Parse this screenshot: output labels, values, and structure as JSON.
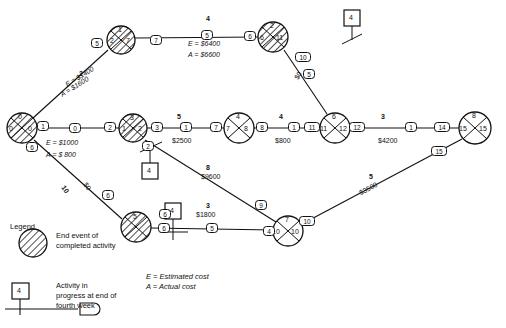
{
  "diagram": {
    "type": "pert-cpm-network",
    "title": "",
    "events": [
      {
        "id": "e0",
        "label_top": "0",
        "label_left": "0",
        "label_right": "0",
        "hatched": true,
        "x": 22,
        "y": 128,
        "r": 15
      },
      {
        "id": "e13",
        "label_top": "1",
        "label_left": "2",
        "label_right": "7",
        "hatched": true,
        "x": 133,
        "y": 128,
        "r": 14
      },
      {
        "id": "e3",
        "label_top": "3",
        "label_left": "1",
        "label_right": "2",
        "hatched": true,
        "x": 133,
        "y": 128,
        "r": 14
      },
      {
        "id": "e_top_left",
        "label_top": "1",
        "label_left": "2",
        "label_right": "7",
        "hatched": true,
        "x": 121,
        "y": 40,
        "r": 14
      },
      {
        "id": "e_top_right",
        "label_top": "2",
        "label_left": "6",
        "label_right": "11",
        "hatched": true,
        "x": 273,
        "y": 37,
        "r": 15
      },
      {
        "id": "e74",
        "label_top": "4",
        "label_left": "7",
        "label_right": "8",
        "hatched": false,
        "x": 239,
        "y": 128,
        "r": 15
      },
      {
        "id": "e1112",
        "label_top": "6",
        "label_left": "11",
        "label_right": "12",
        "hatched": false,
        "x": 335,
        "y": 128,
        "r": 15
      },
      {
        "id": "e1515",
        "label_top": "8",
        "label_left": "15",
        "label_right": "15",
        "hatched": false,
        "x": 475,
        "y": 128,
        "r": 16
      },
      {
        "id": "e_bottom_left",
        "label_top": "5",
        "label_left": "",
        "label_right": "",
        "hatched": true,
        "x": 136,
        "y": 227,
        "r": 15
      },
      {
        "id": "e1010",
        "label_top": "7",
        "label_left": "10",
        "label_right": "10",
        "hatched": false,
        "x": 288,
        "y": 231,
        "r": 15
      }
    ],
    "activity_tags": [
      {
        "text": "5",
        "x": 97,
        "y": 43
      },
      {
        "text": "7",
        "x": 156,
        "y": 40
      },
      {
        "text": "5",
        "x": 207,
        "y": 35
      },
      {
        "text": "6",
        "x": 250,
        "y": 36
      },
      {
        "text": "1",
        "x": 43,
        "y": 126
      },
      {
        "text": "0",
        "x": 75,
        "y": 128
      },
      {
        "text": "2",
        "x": 110,
        "y": 127
      },
      {
        "text": "3",
        "x": 157,
        "y": 127
      },
      {
        "text": "1",
        "x": 186,
        "y": 127
      },
      {
        "text": "7",
        "x": 216,
        "y": 127
      },
      {
        "text": "8",
        "x": 262,
        "y": 127
      },
      {
        "text": "1",
        "x": 294,
        "y": 127
      },
      {
        "text": "11",
        "x": 312,
        "y": 127
      },
      {
        "text": "12",
        "x": 357,
        "y": 127
      },
      {
        "text": "1",
        "x": 411,
        "y": 127
      },
      {
        "text": "14",
        "x": 442,
        "y": 127
      },
      {
        "text": "15",
        "x": 439,
        "y": 151
      },
      {
        "text": "6",
        "x": 32,
        "y": 147
      },
      {
        "text": "2",
        "x": 148,
        "y": 146
      },
      {
        "text": "6",
        "x": 108,
        "y": 195
      },
      {
        "text": "6",
        "x": 165,
        "y": 214
      },
      {
        "text": "6",
        "x": 164,
        "y": 228
      },
      {
        "text": "5",
        "x": 212,
        "y": 228
      },
      {
        "text": "4",
        "x": 269,
        "y": 231
      },
      {
        "text": "10",
        "x": 307,
        "y": 221
      },
      {
        "text": "9",
        "x": 261,
        "y": 205
      },
      {
        "text": "10",
        "x": 303,
        "y": 57
      },
      {
        "text": "5",
        "x": 309,
        "y": 74
      }
    ],
    "edge_labels": [
      {
        "text": "4",
        "x": 206,
        "y": 19
      },
      {
        "text": "2",
        "x": 79,
        "y": 74
      },
      {
        "text": "5",
        "x": 177,
        "y": 117
      },
      {
        "text": "4",
        "x": 279,
        "y": 117
      },
      {
        "text": "3",
        "x": 381,
        "y": 117
      },
      {
        "text": "8",
        "x": 206,
        "y": 168
      },
      {
        "text": "3",
        "x": 206,
        "y": 206
      },
      {
        "text": "5",
        "x": 369,
        "y": 177
      },
      {
        "text": "10",
        "x": 66,
        "y": 186
      }
    ],
    "cost_labels": [
      {
        "text": "E = $6400",
        "x": 188,
        "y": 44
      },
      {
        "text": "A = $6600",
        "x": 188,
        "y": 54
      },
      {
        "text": "E = $1400",
        "x": 64,
        "y": 82,
        "rotate": -32
      },
      {
        "text": "A = $1600",
        "x": 61,
        "y": 92,
        "rotate": -32
      },
      {
        "text": "E = $1000",
        "x": 46,
        "y": 141
      },
      {
        "text": "A = $ 800",
        "x": 46,
        "y": 153
      },
      {
        "text": "$2500",
        "x": 172,
        "y": 140
      },
      {
        "text": "$800",
        "x": 275,
        "y": 140
      },
      {
        "text": "$4200",
        "x": 378,
        "y": 140
      },
      {
        "text": "$9600",
        "x": 201,
        "y": 177
      },
      {
        "text": "$1800",
        "x": 196,
        "y": 214
      },
      {
        "text": "$3500",
        "x": 358,
        "y": 189,
        "rotate": 32
      },
      {
        "text": "$0",
        "x": 293,
        "y": 75,
        "rotate": -60
      },
      {
        "text": "$0",
        "x": 88,
        "y": 183,
        "rotate": 55
      }
    ],
    "week_markers": [
      {
        "text": "4",
        "x": 346,
        "y": 12
      },
      {
        "text": "4",
        "x": 144,
        "y": 165
      },
      {
        "text": "4",
        "x": 167,
        "y": 205
      }
    ]
  },
  "legend": {
    "title": "Legend",
    "items": [
      {
        "symbol": "hatched-circle",
        "text": "End event of completed activity"
      },
      {
        "symbol": "week-marker-box",
        "text": "Activity in progress at end of fourth week",
        "marker_label": "4"
      }
    ],
    "cost_key": [
      {
        "text": "E = Estimated cost"
      },
      {
        "text": "A = Actual cost"
      }
    ]
  },
  "colors": {
    "ink": "#111111",
    "paper": "#ffffff"
  }
}
